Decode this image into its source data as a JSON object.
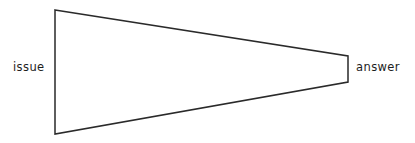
{
  "canvas": {
    "width": 415,
    "height": 143,
    "background_color": "#ffffff"
  },
  "diagram": {
    "type": "funnel-wedge",
    "title": "",
    "stroke_color": "#2a2a2a",
    "stroke_width": 1.5,
    "fill": "none",
    "shape_name": "tapering wedge from issue to answer",
    "vertices": [
      {
        "name": "top-left",
        "x": 55,
        "y": 10
      },
      {
        "name": "top-right",
        "x": 348,
        "y": 56
      },
      {
        "name": "bottom-right",
        "x": 348,
        "y": 82
      },
      {
        "name": "bottom-left",
        "x": 55,
        "y": 134
      }
    ],
    "path": "M 55 10 L 348 56 L 348 82 L 55 134 Z"
  },
  "labels": {
    "left": {
      "text": "issue",
      "color": "#1d1d1d",
      "x": 13,
      "y": 62
    },
    "right": {
      "text": "answer",
      "color": "#1d1d1d",
      "x": 356,
      "y": 62
    }
  }
}
